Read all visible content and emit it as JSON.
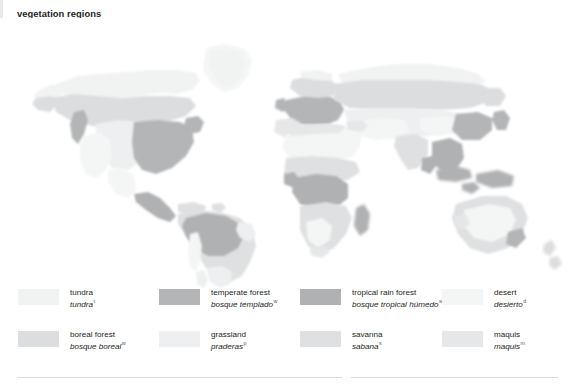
{
  "title": {
    "en": "vegetation regions",
    "es": "distribución de la vegetación",
    "en_marker": "",
    "es_marker_1": "1",
    "es_marker_2": "2"
  },
  "palette": {
    "background": "#ffffff",
    "ocean": "#ffffff",
    "tundra": "#f1f2f2",
    "boreal_forest": "#dcdddf",
    "temperate_forest": "#b4b5b7",
    "grassland": "#eeeff0",
    "tropical_rain_forest": "#b0b1b3",
    "savanna": "#dfe0e1",
    "desert": "#f4f5f5",
    "maquis": "#e6e7e8",
    "coastline": "#c9cacc",
    "text": "#231f20",
    "rule": "#d9dadd"
  },
  "legend": {
    "rows": [
      {
        "items": [
          {
            "key": "tundra",
            "en": "tundra",
            "es": "tundra",
            "marker": "t",
            "color": "#f1f2f2"
          },
          {
            "key": "temperate-forest",
            "en": "temperate forest",
            "es": "bosque templado",
            "marker": "w",
            "color": "#b4b5b7"
          },
          {
            "key": "tropical-rain-forest",
            "en": "tropical rain forest",
            "es": "bosque tropical húmedo",
            "marker": "w",
            "color": "#b0b1b3"
          },
          {
            "key": "desert",
            "en": "desert",
            "es": "desierto",
            "marker": "d",
            "color": "#f4f5f5"
          }
        ]
      },
      {
        "items": [
          {
            "key": "boreal-forest",
            "en": "boreal forest",
            "es": "bosque boreal",
            "marker": "w",
            "color": "#dcdddf"
          },
          {
            "key": "grassland",
            "en": "grassland",
            "es": "praderas",
            "marker": "p",
            "color": "#eeeff0"
          },
          {
            "key": "savanna",
            "en": "savanna",
            "es": "sabana",
            "marker": "s",
            "color": "#dfe0e1"
          },
          {
            "key": "maquis",
            "en": "maquis",
            "es": "maquis",
            "marker": "m",
            "color": "#e6e7e8"
          }
        ]
      }
    ]
  },
  "map": {
    "projection": "world-robinson-like",
    "regions_shown": [
      "tundra",
      "boreal forest",
      "temperate forest",
      "grassland",
      "tropical rain forest",
      "savanna",
      "desert",
      "maquis"
    ],
    "continents": [
      "North America",
      "South America",
      "Europe",
      "Africa",
      "Asia",
      "Australia",
      "Greenland",
      "Southeast Asia"
    ]
  }
}
